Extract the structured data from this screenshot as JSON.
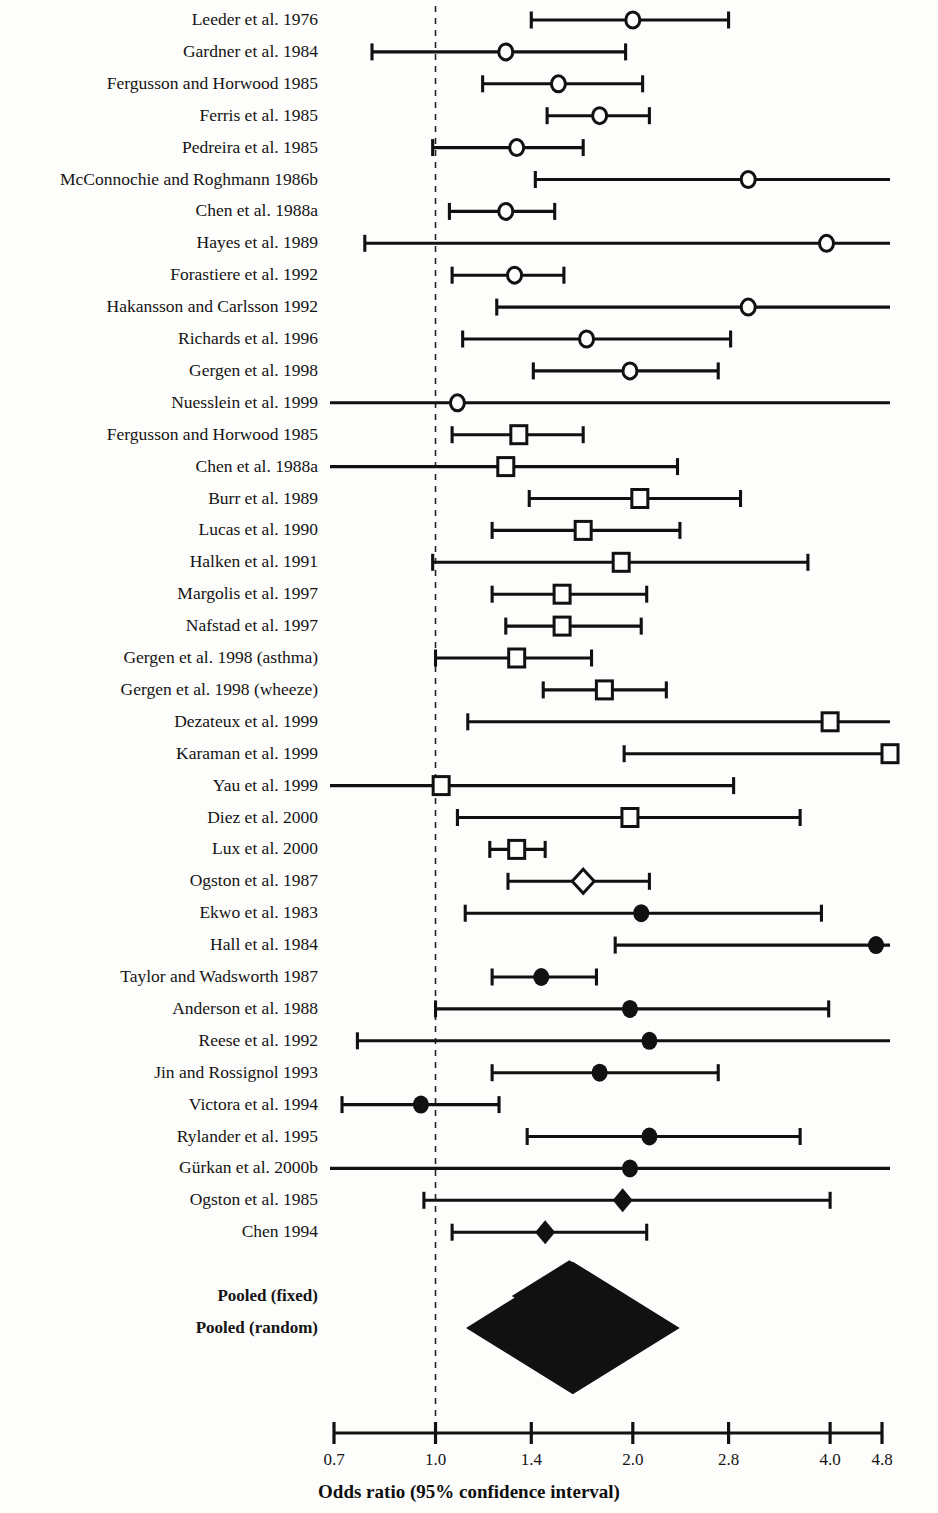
{
  "chart_data": {
    "type": "forest",
    "title": "",
    "xlabel": "Odds ratio (95% confidence interval)",
    "ylabel": "",
    "scale": "log",
    "xlim": [
      0.7,
      4.8
    ],
    "null_line": 1.0,
    "grid": false,
    "legend_position": "none",
    "tick_values": [
      0.7,
      1.0,
      1.4,
      2.0,
      2.8,
      4.0,
      4.8
    ],
    "tick_labels": [
      "0.7",
      "1.0",
      "1.4",
      "2.0",
      "2.8",
      "4.0",
      "4.8"
    ],
    "marker_types": {
      "open-circle": "open circle",
      "open-square": "open square",
      "open-diamond": "open diamond",
      "filled-circle": "filled circle",
      "filled-diamond": "filled diamond",
      "pooled-diamond": "large filled diamond"
    },
    "studies": [
      {
        "label": "Leeder et al. 1976",
        "or": 2.0,
        "lo": 1.4,
        "hi": 2.8,
        "marker": "open-circle"
      },
      {
        "label": "Gardner et al. 1984",
        "or": 1.28,
        "lo": 0.8,
        "hi": 1.95,
        "marker": "open-circle"
      },
      {
        "label": "Fergusson and Horwood 1985",
        "or": 1.54,
        "lo": 1.18,
        "hi": 2.07,
        "marker": "open-circle"
      },
      {
        "label": "Ferris et al. 1985",
        "or": 1.78,
        "lo": 1.48,
        "hi": 2.12,
        "marker": "open-circle"
      },
      {
        "label": "Pedreira et al. 1985",
        "or": 1.33,
        "lo": 0.99,
        "hi": 1.68,
        "marker": "open-circle"
      },
      {
        "label": "McConnochie and Roghmann 1986b",
        "or": 3.0,
        "lo": 1.42,
        "hi": 5.4,
        "marker": "open-circle"
      },
      {
        "label": "Chen et al. 1988a",
        "or": 1.28,
        "lo": 1.05,
        "hi": 1.52,
        "marker": "open-circle"
      },
      {
        "label": "Hayes et al. 1989",
        "or": 3.95,
        "lo": 0.78,
        "hi": 5.4,
        "marker": "open-circle"
      },
      {
        "label": "Forastiere et al. 1992",
        "or": 1.32,
        "lo": 1.06,
        "hi": 1.57,
        "marker": "open-circle"
      },
      {
        "label": "Hakansson and Carlsson 1992",
        "or": 3.0,
        "lo": 1.24,
        "hi": 5.4,
        "marker": "open-circle"
      },
      {
        "label": "Richards et al. 1996",
        "or": 1.7,
        "lo": 1.1,
        "hi": 2.82,
        "marker": "open-circle"
      },
      {
        "label": "Gergen et al. 1998",
        "or": 1.98,
        "lo": 1.41,
        "hi": 2.7,
        "marker": "open-circle"
      },
      {
        "label": "Nuesslein et al. 1999",
        "or": 1.08,
        "lo": 0.62,
        "hi": 5.4,
        "marker": "open-circle"
      },
      {
        "label": "Fergusson and Horwood 1985",
        "or": 1.34,
        "lo": 1.06,
        "hi": 1.68,
        "marker": "open-square"
      },
      {
        "label": "Chen et al. 1988a",
        "or": 1.28,
        "lo": 0.69,
        "hi": 2.34,
        "marker": "open-square"
      },
      {
        "label": "Burr et al. 1989",
        "or": 2.05,
        "lo": 1.39,
        "hi": 2.92,
        "marker": "open-square"
      },
      {
        "label": "Lucas et al. 1990",
        "or": 1.68,
        "lo": 1.22,
        "hi": 2.36,
        "marker": "open-square"
      },
      {
        "label": "Halken et al. 1991",
        "or": 1.92,
        "lo": 0.99,
        "hi": 3.7,
        "marker": "open-square"
      },
      {
        "label": "Margolis et al. 1997",
        "or": 1.56,
        "lo": 1.22,
        "hi": 2.1,
        "marker": "open-square"
      },
      {
        "label": "Nafstad et al. 1997",
        "or": 1.56,
        "lo": 1.28,
        "hi": 2.06,
        "marker": "open-square"
      },
      {
        "label": "Gergen et al. 1998 (asthma)",
        "or": 1.33,
        "lo": 1.0,
        "hi": 1.73,
        "marker": "open-square"
      },
      {
        "label": "Gergen et al. 1998 (wheeze)",
        "or": 1.81,
        "lo": 1.46,
        "hi": 2.25,
        "marker": "open-square"
      },
      {
        "label": "Dezateux et al. 1999",
        "or": 4.0,
        "lo": 1.12,
        "hi": 5.4,
        "marker": "open-square"
      },
      {
        "label": "Karaman et al. 1999",
        "or": 5.1,
        "lo": 1.94,
        "hi": 5.4,
        "marker": "open-square"
      },
      {
        "label": "Yau et al. 1999",
        "or": 1.02,
        "lo": 0.62,
        "hi": 2.85,
        "marker": "open-square"
      },
      {
        "label": "Diez et al. 2000",
        "or": 1.98,
        "lo": 1.08,
        "hi": 3.6,
        "marker": "open-square"
      },
      {
        "label": "Lux et al. 2000",
        "or": 1.33,
        "lo": 1.21,
        "hi": 1.47,
        "marker": "open-square"
      },
      {
        "label": "Ogston et al. 1987",
        "or": 1.68,
        "lo": 1.29,
        "hi": 2.12,
        "marker": "open-diamond"
      },
      {
        "label": "Ekwo et al. 1983",
        "or": 2.06,
        "lo": 1.11,
        "hi": 3.88,
        "marker": "filled-circle"
      },
      {
        "label": "Hall et al. 1984",
        "or": 4.7,
        "lo": 1.88,
        "hi": 5.4,
        "marker": "filled-circle"
      },
      {
        "label": "Taylor and Wadsworth 1987",
        "or": 1.45,
        "lo": 1.22,
        "hi": 1.76,
        "marker": "filled-circle"
      },
      {
        "label": "Anderson et al. 1988",
        "or": 1.98,
        "lo": 1.0,
        "hi": 3.98,
        "marker": "filled-circle"
      },
      {
        "label": "Reese et al. 1992",
        "or": 2.12,
        "lo": 0.76,
        "hi": 5.4,
        "marker": "filled-circle"
      },
      {
        "label": "Jin and Rossignol 1993",
        "or": 1.78,
        "lo": 1.22,
        "hi": 2.7,
        "marker": "filled-circle"
      },
      {
        "label": "Victora et al. 1994",
        "or": 0.95,
        "lo": 0.72,
        "hi": 1.25,
        "marker": "filled-circle"
      },
      {
        "label": "Rylander et al. 1995",
        "or": 2.12,
        "lo": 1.38,
        "hi": 3.6,
        "marker": "filled-circle"
      },
      {
        "label": "Gürkan et al. 2000b",
        "or": 1.98,
        "lo": 0.62,
        "hi": 5.4,
        "marker": "filled-circle"
      },
      {
        "label": "Ogston et al. 1985",
        "or": 1.93,
        "lo": 0.96,
        "hi": 4.0,
        "marker": "filled-diamond"
      },
      {
        "label": "Chen 1994",
        "or": 1.47,
        "lo": 1.06,
        "hi": 2.1,
        "marker": "filled-diamond"
      },
      {
        "label": "",
        "or": null,
        "lo": null,
        "hi": null,
        "marker": "spacer"
      },
      {
        "label": "Pooled (fixed)",
        "or": 1.6,
        "lo": null,
        "hi": null,
        "marker": "pooled-diamond",
        "diamond_half_width": 0.105,
        "bold": true
      },
      {
        "label": "Pooled (random)",
        "or": 1.62,
        "lo": null,
        "hi": null,
        "marker": "pooled-diamond",
        "diamond_half_width": 0.195,
        "bold": true
      }
    ]
  },
  "style": {
    "line_color": "#111111",
    "marker_fill_open": "#fdfdfb",
    "marker_fill_closed": "#111111",
    "background": "#fdfdfb",
    "null_line_color": "#222222"
  }
}
